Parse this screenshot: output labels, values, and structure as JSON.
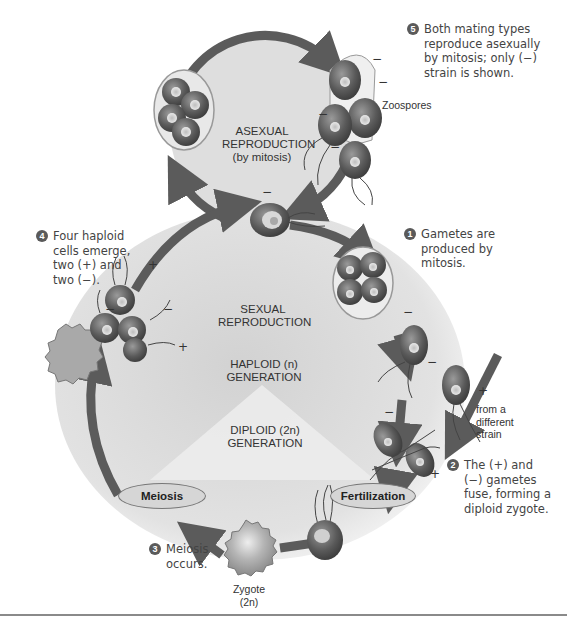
{
  "diagram": {
    "cycles": {
      "asexual": {
        "line1": "ASEXUAL",
        "line2": "REPRODUCTION",
        "line3": "(by mitosis)"
      },
      "sexual": {
        "line1": "SEXUAL",
        "line2": "REPRODUCTION"
      },
      "haploid": {
        "line1": "HAPLOID (n)",
        "line2": "GENERATION"
      },
      "diploid": {
        "line1": "DIPLOID (2n)",
        "line2": "GENERATION"
      }
    },
    "stage_labels": {
      "meiosis": "Meiosis",
      "fertilization": "Fertilization"
    },
    "labels": {
      "zoospores": "Zoospores",
      "zygote_line1": "Zygote",
      "zygote_line2": "(2n)",
      "from_strain_line1": "from a",
      "from_strain_line2": "different",
      "from_strain_line3": "strain"
    },
    "steps": [
      {
        "number": "1",
        "lines": [
          "Gametes are",
          "produced by",
          "mitosis."
        ]
      },
      {
        "number": "2",
        "lines": [
          "The (+) and",
          "(−) gametes",
          "fuse, forming a",
          "diploid zygote."
        ]
      },
      {
        "number": "3",
        "lines": [
          "Meiosis",
          "occurs."
        ]
      },
      {
        "number": "4",
        "lines": [
          "Four haploid",
          "cells emerge,",
          "two (+) and",
          "two (−)."
        ]
      },
      {
        "number": "5",
        "lines": [
          "Both mating types",
          "reproduce asexually",
          "by mitosis; only (−)",
          "strain is shown."
        ]
      }
    ],
    "signs": {
      "plus": "+",
      "minus": "−"
    },
    "colors": {
      "arrow": "#5b5b5b",
      "cycle_fill": "#dcdcdc",
      "cell_dark": "#4a4a4a",
      "oval_fill": "#d6d6d6"
    }
  }
}
